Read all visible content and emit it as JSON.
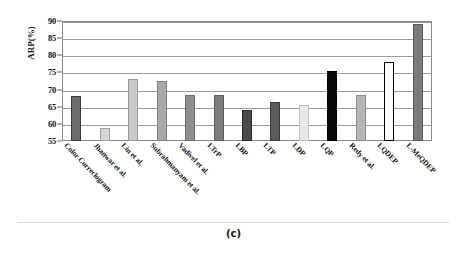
{
  "figure": {
    "caption": "(c)"
  },
  "axis": {
    "y_title": "ARP(%)",
    "y_ticks": [
      "90",
      "85",
      "80",
      "75",
      "70",
      "65",
      "60",
      "55"
    ]
  },
  "chart_data": {
    "type": "bar",
    "title": "",
    "xlabel": "",
    "ylabel": "ARP(%)",
    "ylim": [
      55,
      90
    ],
    "ytick_step": 5,
    "grid": true,
    "legend": "none",
    "categories": [
      "Color Correclogram",
      "Jhanwar et al.",
      "Lin et al.",
      "Subrahmanyam et al.",
      "Vadivel et al.",
      "LTrP",
      "LBP",
      "LTP",
      "LDP",
      "LQP",
      "Redy et al.",
      "LQDEP",
      "L-MeQDEP"
    ],
    "values": [
      68.0,
      58.7,
      73.0,
      72.5,
      68.5,
      68.5,
      64.0,
      66.5,
      65.5,
      75.5,
      68.5,
      78.0,
      89.0
    ],
    "bar_fills": [
      "#6b6b6b",
      "#d6d6d6",
      "#c9c9c9",
      "#a8a8a8",
      "#8f8f8f",
      "#7d7d7d",
      "#4a4a4a",
      "#5c5c5c",
      "#e8e8e8",
      "#0a0a0a",
      "#b5b5b5",
      "#ffffff",
      "#7a7a7a"
    ],
    "bar_strokes": [
      "#3a3a3a",
      "#a0a0a0",
      "#9a9a9a",
      "#808080",
      "#6e6e6e",
      "#5e5e5e",
      "#2a2a2a",
      "#3a3a3a",
      "#c0c0c0",
      "#000000",
      "#8c8c8c",
      "#000000",
      "#5a5a5a"
    ]
  }
}
